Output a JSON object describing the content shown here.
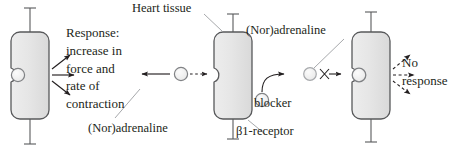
{
  "figure": {
    "background_color": "#ffffff",
    "line_color": "#231f20",
    "cell_fill_color": "#e3e3e3",
    "cell_stroke_color": "#58595b",
    "circle_fill_color": "#f2f2f2"
  },
  "labels": {
    "heart_tissue": "Heart tissue",
    "response_line1": "Response:",
    "response_line2": "increase in",
    "response_line3": "force and",
    "response_line4": "rate of",
    "response_line5": "contraction",
    "noradrenaline_1": "(Nor)adrenaline",
    "noradrenaline_2": "(Nor)adrenaline",
    "blocker": "blocker",
    "b1_receptor": "β1-receptor",
    "no_response_line1": "No",
    "no_response_line2": "response"
  },
  "panels": [
    {
      "id": "panel-bound-agonist",
      "description": "Heart tissue cell with (Nor)adrenaline bound to the β1-receptor producing a response",
      "cell_label": "heart-tissue-cell-1",
      "receptor_state": "occupied-by-agonist",
      "outcome": "Response: increase in force and rate of contraction"
    },
    {
      "id": "panel-free-receptor",
      "description": "Heart tissue cell with an empty β1-receptor and (Nor)adrenaline approaching",
      "cell_label": "heart-tissue-cell-2",
      "receptor_state": "empty",
      "outcome": "agonist binding"
    },
    {
      "id": "panel-blocked-receptor",
      "description": "Heart tissue cell with a blocker occupying the β1-receptor; (Nor)adrenaline cannot bind",
      "cell_label": "heart-tissue-cell-3",
      "receptor_state": "occupied-by-blocker",
      "outcome": "No response"
    }
  ]
}
